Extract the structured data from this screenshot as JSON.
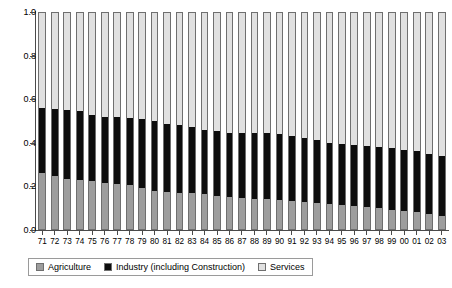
{
  "chart_data": {
    "type": "bar",
    "subtype": "stacked-bar-100-percent",
    "title": "",
    "xlabel": "",
    "ylabel": "",
    "ylim": [
      0.0,
      1.0
    ],
    "yticks": [
      "1.0",
      "0.8",
      "0.6",
      "0.4",
      "0.2",
      "0.0"
    ],
    "ytick_values": [
      1.0,
      0.8,
      0.6,
      0.4,
      0.2,
      0.0
    ],
    "grid": false,
    "legend_position": "bottom",
    "categories": [
      "71",
      "72",
      "73",
      "74",
      "75",
      "76",
      "77",
      "78",
      "79",
      "80",
      "81",
      "82",
      "83",
      "84",
      "85",
      "86",
      "87",
      "88",
      "89",
      "90",
      "91",
      "92",
      "93",
      "94",
      "95",
      "96",
      "97",
      "98",
      "99",
      "00",
      "01",
      "02",
      "03"
    ],
    "series": [
      {
        "name": "Agriculture",
        "color": "#9d9d9d",
        "values": [
          0.26,
          0.245,
          0.23,
          0.225,
          0.22,
          0.215,
          0.21,
          0.205,
          0.19,
          0.175,
          0.17,
          0.165,
          0.165,
          0.16,
          0.155,
          0.15,
          0.145,
          0.14,
          0.14,
          0.135,
          0.13,
          0.125,
          0.12,
          0.115,
          0.11,
          0.105,
          0.1,
          0.095,
          0.09,
          0.085,
          0.08,
          0.07,
          0.06
        ]
      },
      {
        "name": "Industry (including Construction)",
        "color": "#0d0d0d",
        "values": [
          0.3,
          0.31,
          0.32,
          0.32,
          0.31,
          0.305,
          0.31,
          0.31,
          0.32,
          0.325,
          0.315,
          0.315,
          0.305,
          0.3,
          0.3,
          0.295,
          0.3,
          0.305,
          0.305,
          0.305,
          0.3,
          0.295,
          0.29,
          0.285,
          0.285,
          0.285,
          0.285,
          0.285,
          0.285,
          0.28,
          0.28,
          0.275,
          0.28
        ]
      },
      {
        "name": "Services",
        "color": "#e0e0e0",
        "values": [
          0.44,
          0.445,
          0.45,
          0.455,
          0.47,
          0.48,
          0.48,
          0.485,
          0.49,
          0.5,
          0.515,
          0.52,
          0.53,
          0.54,
          0.545,
          0.555,
          0.555,
          0.555,
          0.555,
          0.56,
          0.57,
          0.58,
          0.59,
          0.6,
          0.605,
          0.61,
          0.615,
          0.62,
          0.625,
          0.635,
          0.64,
          0.655,
          0.66
        ]
      }
    ],
    "legend": [
      {
        "label": "Agriculture",
        "color": "#9d9d9d"
      },
      {
        "label": "Industry (including Construction)",
        "color": "#0d0d0d"
      },
      {
        "label": "Services",
        "color": "#e0e0e0"
      }
    ]
  }
}
